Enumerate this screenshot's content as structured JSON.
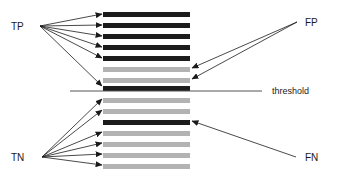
{
  "figure": {
    "type": "classification-threshold-diagram",
    "background": "#ffffff",
    "width": 337,
    "height": 176
  },
  "labels": {
    "tp": "TP",
    "tn": "TN",
    "fp": "FP",
    "fn": "FN",
    "threshold": "threshold"
  },
  "colors": {
    "positive_bar": "#1c1c1c",
    "negative_bar": "#b3b3b3",
    "arrow": "#1a1a1a",
    "threshold_line": "#555555",
    "text": "#1a1a1a"
  },
  "geometry": {
    "bar_left": 103,
    "bar_right": 190,
    "bar_height": 5,
    "bar_pitch": 11.3,
    "threshold_y": 91,
    "threshold_line_x1": 70,
    "threshold_line_x2": 262,
    "tp_origin": [
      40,
      26
    ],
    "tn_origin": [
      42,
      157
    ],
    "fp_origin": [
      297,
      22
    ],
    "fn_origin": [
      296,
      157
    ]
  },
  "label_positions": {
    "tp": [
      11,
      30
    ],
    "tn": [
      11,
      161
    ],
    "fp": [
      305,
      26
    ],
    "fn": [
      305,
      161
    ],
    "threshold": [
      272,
      94
    ]
  },
  "chart_data": {
    "type": "bar",
    "title": "",
    "categories": [
      "rank-1",
      "rank-2",
      "rank-3",
      "rank-4",
      "rank-5",
      "rank-6",
      "rank-7",
      "rank-8",
      "rank-9",
      "rank-10",
      "rank-11",
      "rank-12",
      "rank-13",
      "rank-14",
      "rank-15"
    ],
    "bars": [
      {
        "index": 1,
        "y": 12,
        "class": "positive",
        "side": "above",
        "outcome": "TP"
      },
      {
        "index": 2,
        "y": 23,
        "class": "positive",
        "side": "above",
        "outcome": "TP"
      },
      {
        "index": 3,
        "y": 34,
        "class": "positive",
        "side": "above",
        "outcome": "TP"
      },
      {
        "index": 4,
        "y": 45,
        "class": "positive",
        "side": "above",
        "outcome": "TP"
      },
      {
        "index": 5,
        "y": 56,
        "class": "positive",
        "side": "above",
        "outcome": "TP"
      },
      {
        "index": 6,
        "y": 67,
        "class": "negative",
        "side": "above",
        "outcome": "FP"
      },
      {
        "index": 7,
        "y": 78,
        "class": "negative",
        "side": "above",
        "outcome": "FP"
      },
      {
        "index": 8,
        "y": 86,
        "class": "positive",
        "side": "above",
        "outcome": "TP"
      },
      {
        "index": 9,
        "y": 98,
        "class": "negative",
        "side": "below",
        "outcome": "TN"
      },
      {
        "index": 10,
        "y": 109,
        "class": "negative",
        "side": "below",
        "outcome": "TN"
      },
      {
        "index": 11,
        "y": 120,
        "class": "positive",
        "side": "below",
        "outcome": "FN"
      },
      {
        "index": 12,
        "y": 131,
        "class": "negative",
        "side": "below",
        "outcome": "TN"
      },
      {
        "index": 13,
        "y": 142,
        "class": "negative",
        "side": "below",
        "outcome": "TN"
      },
      {
        "index": 14,
        "y": 153,
        "class": "negative",
        "side": "below",
        "outcome": "TN"
      },
      {
        "index": 15,
        "y": 164,
        "class": "negative",
        "side": "below",
        "outcome": "TN"
      }
    ],
    "counts": {
      "TP": 6,
      "FP": 2,
      "TN": 6,
      "FN": 1,
      "total": 15
    },
    "xlabel": "",
    "ylabel": "",
    "legend": [
      "TP",
      "FP",
      "TN",
      "FN",
      "threshold"
    ],
    "grid": false
  },
  "arrows": {
    "tp": [
      {
        "from": [
          40,
          26
        ],
        "to": [
          102,
          14
        ]
      },
      {
        "from": [
          40,
          26
        ],
        "to": [
          102,
          25
        ]
      },
      {
        "from": [
          40,
          26
        ],
        "to": [
          102,
          36
        ]
      },
      {
        "from": [
          40,
          26
        ],
        "to": [
          102,
          47
        ]
      },
      {
        "from": [
          40,
          26
        ],
        "to": [
          102,
          58
        ]
      },
      {
        "from": [
          40,
          26
        ],
        "to": [
          102,
          86
        ]
      }
    ],
    "tn": [
      {
        "from": [
          42,
          157
        ],
        "to": [
          102,
          99
        ]
      },
      {
        "from": [
          42,
          157
        ],
        "to": [
          102,
          110
        ]
      },
      {
        "from": [
          42,
          157
        ],
        "to": [
          102,
          132
        ]
      },
      {
        "from": [
          42,
          157
        ],
        "to": [
          102,
          143
        ]
      },
      {
        "from": [
          42,
          157
        ],
        "to": [
          102,
          154
        ]
      },
      {
        "from": [
          42,
          157
        ],
        "to": [
          102,
          165
        ]
      }
    ],
    "fp": [
      {
        "from": [
          297,
          22
        ],
        "to": [
          192,
          68
        ]
      },
      {
        "from": [
          297,
          22
        ],
        "to": [
          192,
          79
        ]
      }
    ],
    "fn": [
      {
        "from": [
          296,
          157
        ],
        "to": [
          192,
          121
        ]
      }
    ]
  }
}
